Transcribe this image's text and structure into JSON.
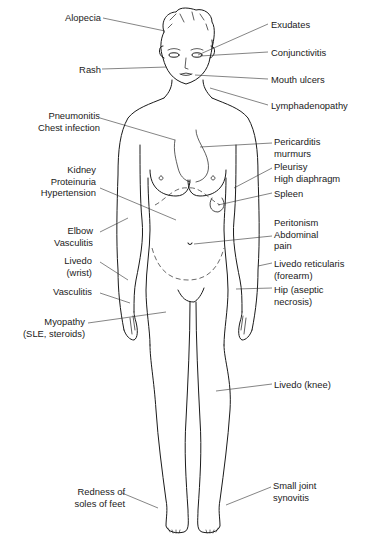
{
  "figure": {
    "labels_left": [
      {
        "id": "alopecia",
        "lines": [
          "Alopecia"
        ],
        "x": 60,
        "y": 12
      },
      {
        "id": "rash",
        "lines": [
          "Rash"
        ],
        "x": 77,
        "y": 64
      },
      {
        "id": "pneumonitis",
        "lines": [
          "Pneumonitis",
          "Chest infection"
        ],
        "x": 29,
        "y": 111
      },
      {
        "id": "kidney",
        "lines": [
          "Kidney",
          "Proteinuria",
          "Hypertension"
        ],
        "x": 33,
        "y": 164
      },
      {
        "id": "elbow",
        "lines": [
          "Elbow",
          "Vasculitis"
        ],
        "x": 47,
        "y": 225
      },
      {
        "id": "livedo-wrist",
        "lines": [
          "Livedo",
          "(wrist)"
        ],
        "x": 62,
        "y": 255
      },
      {
        "id": "vasculitis",
        "lines": [
          "Vasculitis"
        ],
        "x": 48,
        "y": 286
      },
      {
        "id": "myopathy",
        "lines": [
          "Myopathy",
          "(SLE, steroids)"
        ],
        "x": 16,
        "y": 315
      },
      {
        "id": "redness-soles",
        "lines": [
          "Redness of",
          "soles of feet"
        ],
        "x": 69,
        "y": 486
      }
    ],
    "labels_right": [
      {
        "id": "exudates",
        "lines": [
          "Exudates"
        ],
        "x": 270,
        "y": 19
      },
      {
        "id": "conjunctivitis",
        "lines": [
          "Conjunctivitis"
        ],
        "x": 270,
        "y": 47
      },
      {
        "id": "mouth-ulcers",
        "lines": [
          "Mouth ulcers"
        ],
        "x": 270,
        "y": 74
      },
      {
        "id": "lymphadenopathy",
        "lines": [
          "Lymphadenopathy"
        ],
        "x": 270,
        "y": 100
      },
      {
        "id": "pericarditis",
        "lines": [
          "Pericarditis",
          "murmurs"
        ],
        "x": 274,
        "y": 136
      },
      {
        "id": "pleurisy",
        "lines": [
          "Pleurisy",
          "High diaphragm"
        ],
        "x": 274,
        "y": 161
      },
      {
        "id": "spleen",
        "lines": [
          "Spleen"
        ],
        "x": 274,
        "y": 188
      },
      {
        "id": "peritonism",
        "lines": [
          "Peritonism",
          "Abdominal",
          "pain"
        ],
        "x": 274,
        "y": 217
      },
      {
        "id": "livedo-forearm",
        "lines": [
          "Livedo reticularis",
          "(forearm)"
        ],
        "x": 274,
        "y": 258
      },
      {
        "id": "hip",
        "lines": [
          "Hip (aseptic",
          "necrosis)"
        ],
        "x": 274,
        "y": 284
      },
      {
        "id": "livedo-knee",
        "lines": [
          "Livedo (knee)"
        ],
        "x": 274,
        "y": 379
      },
      {
        "id": "small-joint",
        "lines": [
          "Small joint",
          "synovitis"
        ],
        "x": 273,
        "y": 480
      }
    ]
  }
}
